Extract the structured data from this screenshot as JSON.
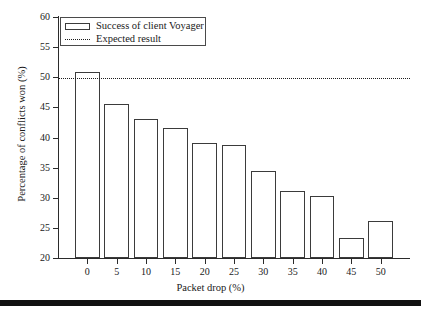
{
  "chart_data": {
    "type": "bar",
    "title": "",
    "xlabel": "Packet drop (%)",
    "ylabel": "Percentage of conflicts won (%)",
    "categories": [
      "0",
      "5",
      "10",
      "15",
      "20",
      "25",
      "30",
      "35",
      "40",
      "45",
      "50"
    ],
    "values": [
      50.8,
      45.5,
      43.1,
      41.5,
      39.1,
      38.7,
      34.5,
      31.1,
      30.3,
      23.4,
      26.1
    ],
    "series": [
      {
        "name": "Success of client Voyager",
        "values": [
          50.8,
          45.5,
          43.1,
          41.5,
          39.1,
          38.7,
          34.5,
          31.1,
          30.3,
          23.4,
          26.1
        ]
      }
    ],
    "reference_lines": [
      {
        "name": "Expected result",
        "value": 49.8,
        "style": "dotted"
      }
    ],
    "xlim": [
      -5,
      55
    ],
    "ylim": [
      20,
      60
    ],
    "yticks": [
      20,
      25,
      30,
      35,
      40,
      45,
      50,
      55,
      60
    ],
    "ytick_labels": [
      "20",
      "25",
      "30",
      "35",
      "40",
      "45",
      "50",
      "55",
      "60"
    ],
    "xticks": [
      0,
      5,
      10,
      15,
      20,
      25,
      30,
      35,
      40,
      45,
      50
    ],
    "xtick_labels": [
      "0",
      "5",
      "10",
      "15",
      "20",
      "25",
      "30",
      "35",
      "40",
      "45",
      "50"
    ],
    "grid": false,
    "legend_position": "top-left",
    "legend": [
      {
        "label": "Success of client Voyager",
        "marker": "bar-outline"
      },
      {
        "label": "Expected result",
        "marker": "dotted-line"
      }
    ],
    "colors": {
      "bar_fill": "#ffffff",
      "bar_edge": "#3b3b3b",
      "axis": "#2b2b2b",
      "expected_line": "#1d1d1d",
      "background": "#ffffff"
    }
  }
}
